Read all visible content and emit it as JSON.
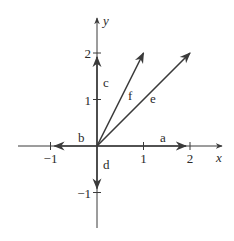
{
  "diagram": {
    "type": "vector-plot",
    "axes": {
      "x_label": "x",
      "y_label": "y",
      "x_ticks": [
        {
          "value": -1,
          "label": "−1"
        },
        {
          "value": 1,
          "label": "1"
        },
        {
          "value": 2,
          "label": "2"
        }
      ],
      "y_ticks": [
        {
          "value": -1,
          "label": "−1"
        },
        {
          "value": 1,
          "label": "1"
        },
        {
          "value": 2,
          "label": "2"
        }
      ]
    },
    "vectors": [
      {
        "name": "a",
        "from": [
          0,
          0
        ],
        "to": [
          2,
          0
        ]
      },
      {
        "name": "b",
        "from": [
          0,
          0
        ],
        "to": [
          -1,
          0
        ]
      },
      {
        "name": "c",
        "from": [
          0,
          0
        ],
        "to": [
          0,
          2
        ]
      },
      {
        "name": "d",
        "from": [
          0,
          0
        ],
        "to": [
          0,
          -1
        ]
      },
      {
        "name": "e",
        "from": [
          0,
          0
        ],
        "to": [
          2,
          2
        ]
      },
      {
        "name": "f",
        "from": [
          0,
          0
        ],
        "to": [
          1,
          2
        ]
      }
    ],
    "colors": {
      "stroke": "#3a3a3a",
      "text": "#2a2a2a"
    }
  }
}
